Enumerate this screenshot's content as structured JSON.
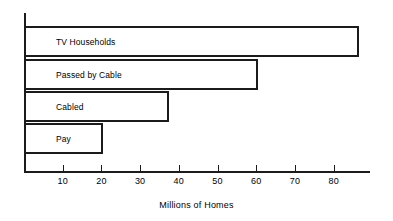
{
  "chart_data": {
    "type": "bar",
    "orientation": "horizontal",
    "title": "",
    "xlabel": "Millions of Homes",
    "ylabel": "",
    "categories": [
      "TV Households",
      "Passed by Cable",
      "Cabled",
      "Pay"
    ],
    "values": [
      86,
      60,
      37,
      20
    ],
    "xlim": [
      0,
      89
    ],
    "xticks": [
      10,
      20,
      30,
      40,
      50,
      60,
      70,
      80
    ],
    "xtick_labels": [
      "10",
      "20",
      "30",
      "40",
      "50",
      "60",
      "70",
      "80"
    ],
    "grid": false,
    "legend": null,
    "bar_fill": "#ffffff",
    "bar_stroke": "#1b1b1b",
    "axis_color": "#1b1b1b",
    "background": "#ffffff"
  },
  "layout": {
    "origin_x_px": 24,
    "px_per_unit": 3.871,
    "bar_rows": [
      {
        "top_px": 26,
        "height_px": 31
      },
      {
        "top_px": 59,
        "height_px": 31
      },
      {
        "top_px": 91,
        "height_px": 31
      },
      {
        "top_px": 123,
        "height_px": 31
      }
    ]
  }
}
